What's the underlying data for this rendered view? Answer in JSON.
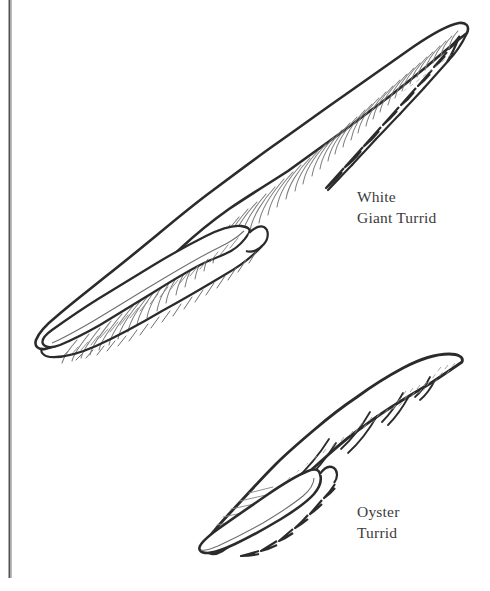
{
  "plate": {
    "width": 490,
    "height": 591,
    "background_color": "#ffffff",
    "ink_color": "#2b2b2b",
    "hatch_color": "#8a8a8a",
    "label_color": "#3b3b3b",
    "rule_color": "#555555"
  },
  "border": {
    "left_rule": {
      "name": "left-vertical-rule",
      "x": 9,
      "y_start": 0,
      "y_end": 578,
      "thickness": 2,
      "color": "#555555"
    }
  },
  "labels": [
    {
      "id": "white-giant-turrid",
      "line1": "White",
      "line2": "Giant Turrid",
      "text": "White\nGiant Turrid",
      "x": 357,
      "y": 186
    },
    {
      "id": "oyster-turrid",
      "line1": "Oyster",
      "line2": "Turrid",
      "text": "Oyster\nTurrid",
      "x": 357,
      "y": 501
    }
  ],
  "specimens": [
    {
      "id": "white-giant-turrid",
      "common_name": "White Giant Turrid",
      "label_lines": [
        "White",
        "Giant Turrid"
      ],
      "orientation": "diagonal, apex upper-right, siphonal canal lower-left",
      "apex_point": [
        468,
        33
      ],
      "canal_tip_point": [
        42,
        346
      ],
      "widest_point": [
        205,
        190
      ],
      "sculpture": "dense axial ribs with fine spiral hatching",
      "aperture": "long narrow aperture with anal sinus notch along lower-left flank",
      "rib_count": 46
    },
    {
      "id": "oyster-turrid",
      "common_name": "Oyster Turrid",
      "label_lines": [
        "Oyster",
        "Turrid"
      ],
      "orientation": "diagonal, apex upper-right, aperture lower-left",
      "apex_point": [
        462,
        362
      ],
      "canal_tip_point": [
        212,
        552
      ],
      "widest_point": [
        300,
        455
      ],
      "sculpture": "banded whorls with fine axial striae",
      "aperture": "broad ovate aperture at lower-left",
      "whorl_count": 6
    }
  ]
}
